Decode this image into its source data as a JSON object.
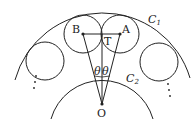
{
  "diagram": {
    "labels": {
      "B": "B",
      "A": "A",
      "T": "T",
      "O": "O",
      "C1": "C",
      "C1_sub": "1",
      "C2": "C",
      "C2_sub": "2",
      "theta_left": "θ",
      "theta_right": "θ"
    },
    "colors": {
      "stroke": "#222222",
      "background": "#ffffff"
    }
  }
}
